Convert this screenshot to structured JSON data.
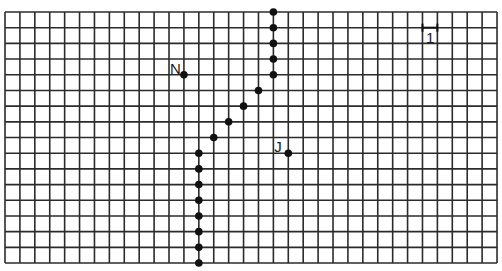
{
  "grid": {
    "origin_x": 5,
    "origin_y": 12,
    "cols": 33,
    "rows": 16,
    "cell_w": 14.91,
    "cell_h": 15.69,
    "line_color": "#2b2b2b",
    "dot_color": "#111111"
  },
  "path_points": [
    {
      "col": 18,
      "row": 0
    },
    {
      "col": 18,
      "row": 1
    },
    {
      "col": 18,
      "row": 2
    },
    {
      "col": 18,
      "row": 3
    },
    {
      "col": 18,
      "row": 4
    },
    {
      "col": 17,
      "row": 5
    },
    {
      "col": 16,
      "row": 6
    },
    {
      "col": 15,
      "row": 7
    },
    {
      "col": 14,
      "row": 8
    },
    {
      "col": 13,
      "row": 9
    },
    {
      "col": 13,
      "row": 10
    },
    {
      "col": 13,
      "row": 11
    },
    {
      "col": 13,
      "row": 12
    },
    {
      "col": 13,
      "row": 13
    },
    {
      "col": 13,
      "row": 14
    },
    {
      "col": 13,
      "row": 15
    },
    {
      "col": 13,
      "row": 16
    }
  ],
  "labeled_points": [
    {
      "label": "N",
      "col": 12,
      "row": 4
    },
    {
      "label": "J",
      "col": 19,
      "row": 9
    }
  ],
  "scale": {
    "label": "1",
    "col_start": 28,
    "col_end": 29,
    "row": 1
  }
}
